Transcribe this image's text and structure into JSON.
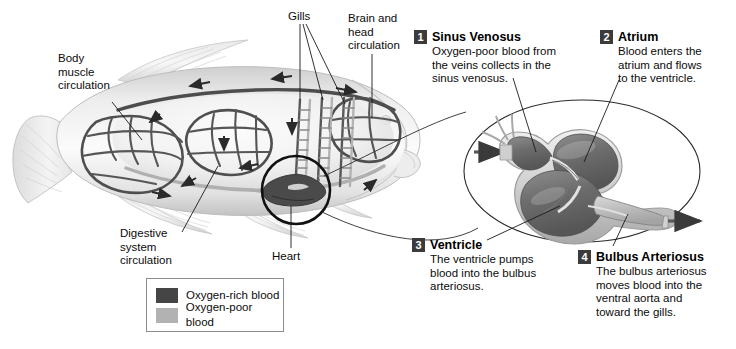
{
  "diagram": {
    "background_color": "#ffffff"
  },
  "fish_labels": [
    {
      "id": "body-muscle-circulation",
      "text": "Body\nmuscle\ncirculation"
    },
    {
      "id": "gills",
      "text": "Gills"
    },
    {
      "id": "brain-head-circulation",
      "text": "Brain and\nhead\ncirculation"
    },
    {
      "id": "digestive-system-circulation",
      "text": "Digestive\nsystem\ncirculation"
    },
    {
      "id": "heart",
      "text": "Heart"
    }
  ],
  "steps": [
    {
      "number": "1",
      "title": "Sinus Venosus",
      "body": "Oxygen-poor blood from\nthe veins collects in the\nsinus venosus."
    },
    {
      "number": "2",
      "title": "Atrium",
      "body": "Blood enters the\natrium and flows\nto the ventricle."
    },
    {
      "number": "3",
      "title": "Ventricle",
      "body": "The ventricle pumps\nblood into the bulbus\narteriosus."
    },
    {
      "number": "4",
      "title": "Bulbus Arteriosus",
      "body": "The bulbus arteriosus\nmoves blood into the\nventral aorta and\ntoward the gills."
    }
  ],
  "legend": {
    "items": [
      {
        "label": "Oxygen-rich blood",
        "color": "#454545"
      },
      {
        "label": "Oxygen-poor blood",
        "color": "#b2b2b2"
      }
    ]
  },
  "colors": {
    "badge": "#3b3b3b",
    "text": "#0b0b0b",
    "leader_line": "#1a1a1a",
    "fish_body_light": "#f2f2f2",
    "fish_body_mid": "#d8d8d8",
    "fish_body_dark": "#9a9a9a",
    "vessel_dark": "#4a4a4a",
    "vessel_light": "#b5b5b5",
    "legend_border": "#8d8d8d"
  }
}
